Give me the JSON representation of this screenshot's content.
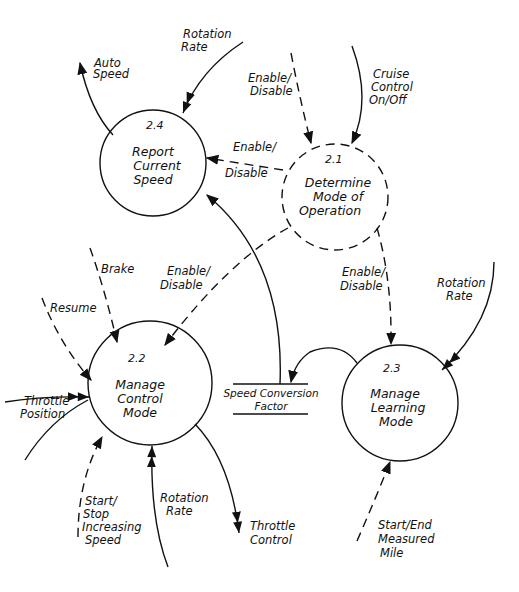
{
  "diagram": {
    "type": "data-flow-diagram",
    "processes": [
      {
        "id": "2.1",
        "title_lines": [
          "Determine",
          "Mode of",
          "Operation"
        ],
        "style": "dashed",
        "cx": 335,
        "cy": 197,
        "r": 53
      },
      {
        "id": "2.2",
        "title_lines": [
          "Manage",
          "Control",
          "Mode"
        ],
        "style": "solid",
        "cx": 150,
        "cy": 383,
        "r": 62
      },
      {
        "id": "2.3",
        "title_lines": [
          "Manage",
          "Learning",
          "Mode"
        ],
        "style": "solid",
        "cx": 400,
        "cy": 403,
        "r": 58
      },
      {
        "id": "2.4",
        "title_lines": [
          "Report",
          "Current",
          "Speed"
        ],
        "style": "solid",
        "cx": 153,
        "cy": 163,
        "r": 53
      }
    ],
    "data_store": {
      "label_lines": [
        "Speed Conversion",
        "Factor"
      ]
    },
    "flows": [
      {
        "label_lines": [
          "Rotation",
          "Rate"
        ],
        "target": "2.4",
        "kind": "data"
      },
      {
        "label_lines": [
          "Auto",
          "Speed"
        ],
        "source": "2.4",
        "kind": "data"
      },
      {
        "label_lines": [
          "Enable/",
          "Disable"
        ],
        "target": "2.1",
        "kind": "control"
      },
      {
        "label_lines": [
          "Cruise",
          "Control",
          "On/Off"
        ],
        "target": "2.1",
        "kind": "data"
      },
      {
        "label_lines": [
          "Enable/",
          "Disable"
        ],
        "source": "2.1",
        "target": "2.4",
        "kind": "control"
      },
      {
        "label_lines": [
          "Enable/",
          "Disable"
        ],
        "source": "2.1",
        "target": "2.2",
        "kind": "control"
      },
      {
        "label_lines": [
          "Enable/",
          "Disable"
        ],
        "source": "2.1",
        "target": "2.3",
        "kind": "control"
      },
      {
        "label_lines": [
          "Brake"
        ],
        "target": "2.2",
        "kind": "control"
      },
      {
        "label_lines": [
          "Resume"
        ],
        "target": "2.2",
        "kind": "control"
      },
      {
        "label_lines": [
          "Throttle",
          "Position"
        ],
        "target": "2.2",
        "kind": "data"
      },
      {
        "label_lines": [
          "Start/",
          "Stop",
          "Increasing",
          "Speed"
        ],
        "target": "2.2",
        "kind": "control"
      },
      {
        "label_lines": [
          "Rotation",
          "Rate"
        ],
        "target": "2.2",
        "kind": "data"
      },
      {
        "label_lines": [
          "Throttle",
          "Control"
        ],
        "source": "2.2",
        "kind": "data"
      },
      {
        "label_lines": [
          "Rotation",
          "Rate"
        ],
        "target": "2.3",
        "kind": "data"
      },
      {
        "label_lines": [
          "Start/End",
          "Measured",
          "Mile"
        ],
        "target": "2.3",
        "kind": "control"
      },
      {
        "source": "2.3",
        "target": "data_store",
        "kind": "data"
      },
      {
        "source": "data_store",
        "target": "2.4",
        "kind": "data"
      }
    ]
  }
}
